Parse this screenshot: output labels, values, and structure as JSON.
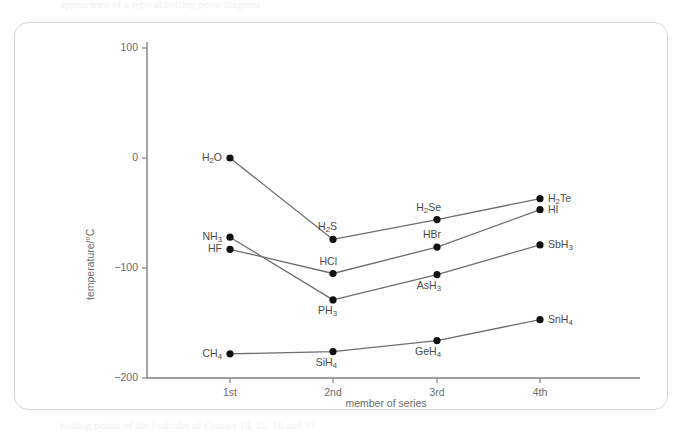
{
  "figure": {
    "crop_text_top": "appearance of a typical boiling point diagram",
    "crop_text_bottom": "boiling points of the hydrides of Groups 14, 15, 16 and 17"
  },
  "axes": {
    "y_title": "temperature/°C",
    "x_title": "member of series",
    "y_ticks": [
      "100",
      "0",
      "−100",
      "−200"
    ],
    "x_ticks": [
      "1st",
      "2nd",
      "3rd",
      "4th"
    ]
  },
  "colors": {
    "card_border": "#d6d6d6",
    "axis": "#808080",
    "series_line": "#6e6e6e",
    "dot": "#111111",
    "label_text": "#4a4a4a",
    "tick_text": "#6b6b6b"
  },
  "chart_data": {
    "type": "line",
    "title": "",
    "xlabel": "member of series",
    "ylabel": "temperature/°C",
    "categories": [
      "1st",
      "2nd",
      "3rd",
      "4th"
    ],
    "ylim": [
      -200,
      100
    ],
    "xlim": [
      0.5,
      4.5
    ],
    "yticks": [
      100,
      0,
      -100,
      -200
    ],
    "grid": false,
    "legend": "none (points labelled directly)",
    "series": [
      {
        "name": "Group 16 hydrides",
        "point_labels": [
          "H2O",
          "H2S",
          "H2Se",
          "H2Te"
        ],
        "point_labels_display": [
          "H₂O",
          "H₂S",
          "H₂Se",
          "H₂Te"
        ],
        "values": [
          0,
          -74,
          -56,
          -37
        ]
      },
      {
        "name": "Group 17 hydrides",
        "point_labels": [
          "HF",
          "HCl",
          "HBr",
          "HI"
        ],
        "point_labels_display": [
          "HF",
          "HCl",
          "HBr",
          "HI"
        ],
        "values": [
          -83,
          -105,
          -81,
          -47
        ]
      },
      {
        "name": "Group 15 hydrides",
        "point_labels": [
          "NH3",
          "PH3",
          "AsH3",
          "SbH3"
        ],
        "point_labels_display": [
          "NH₃",
          "PH₃",
          "AsH₃",
          "SbH₃"
        ],
        "values": [
          -72,
          -129,
          -106,
          -79
        ]
      },
      {
        "name": "Group 14 hydrides",
        "point_labels": [
          "CH4",
          "SiH4",
          "GeH4",
          "SnH4"
        ],
        "point_labels_display": [
          "CH₄",
          "SiH₄",
          "GeH₄",
          "SnH₄"
        ],
        "values": [
          -178,
          -176,
          -166,
          -147
        ]
      }
    ],
    "point_label_html": {
      "H2O": "H<sub>2</sub>O",
      "H2S": "H<sub>2</sub>S",
      "H2Se": "H<sub>2</sub>Se",
      "H2Te": "H<sub>2</sub>Te",
      "HF": "HF",
      "HCl": "HCl",
      "HBr": "HBr",
      "HI": "HI",
      "NH3": "NH<sub>3</sub>",
      "PH3": "PH<sub>3</sub>",
      "AsH3": "AsH<sub>3</sub>",
      "SbH3": "SbH<sub>3</sub>",
      "CH4": "CH<sub>4</sub>",
      "SiH4": "SiH<sub>4</sub>",
      "GeH4": "GeH<sub>4</sub>",
      "SnH4": "SnH<sub>4</sub>"
    },
    "label_placement": {
      "H2O": "left",
      "H2S": "above-left",
      "H2Se": "above-left",
      "H2Te": "right",
      "HF": "left",
      "HCl": "above-left",
      "HBr": "above-left",
      "HI": "right",
      "NH3": "left",
      "PH3": "below-left",
      "AsH3": "below-left",
      "SbH3": "right",
      "CH4": "left",
      "SiH4": "below-left",
      "GeH4": "below-left",
      "SnH4": "right"
    }
  }
}
